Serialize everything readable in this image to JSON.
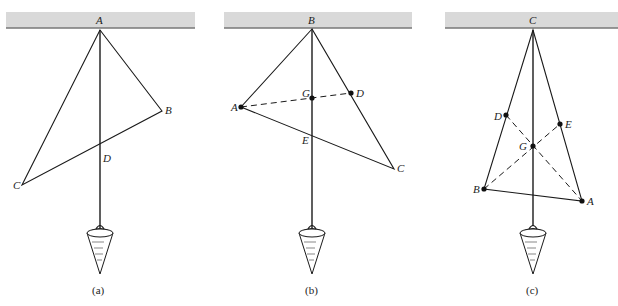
{
  "figure": {
    "panels": [
      {
        "id": "a",
        "caption": "(a)",
        "suspension_point": "A",
        "vertices": {
          "A": "A",
          "B": "B",
          "C": "C"
        },
        "plumb_intersection": "D",
        "labels": {
          "A": "A",
          "B": "B",
          "C": "C",
          "D": "D"
        }
      },
      {
        "id": "b",
        "caption": "(b)",
        "suspension_point": "B",
        "labels": {
          "A": "A",
          "B": "B",
          "C": "C",
          "D": "D",
          "E": "E",
          "G": "G"
        },
        "dashed_line": "A–D"
      },
      {
        "id": "c",
        "caption": "(c)",
        "suspension_point": "C",
        "labels": {
          "A": "A",
          "B": "B",
          "C": "C",
          "D": "D",
          "E": "E",
          "G": "G"
        },
        "dashed_lines": [
          "A–D",
          "B–E"
        ]
      }
    ],
    "colors": {
      "ceiling": "#d9d9d9",
      "ceiling_edge": "#777777",
      "line": "#1a1a1a"
    }
  }
}
